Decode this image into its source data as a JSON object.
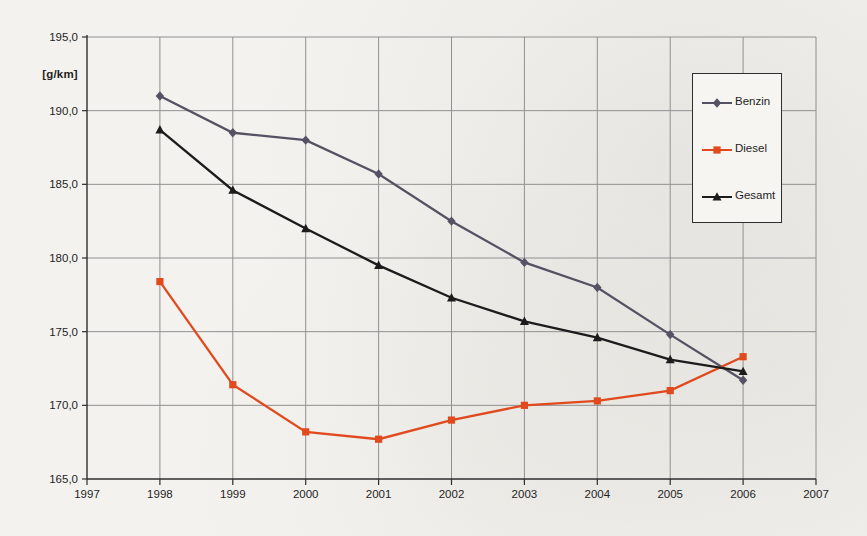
{
  "chart_data": {
    "type": "line",
    "title": "",
    "ylabel": "[g/km]",
    "xlabel": "",
    "xlim": [
      1997,
      2007
    ],
    "ylim": [
      165,
      195
    ],
    "xticks": [
      1997,
      1998,
      1999,
      2000,
      2001,
      2002,
      2003,
      2004,
      2005,
      2006,
      2007
    ],
    "ytick_values": [
      165,
      170,
      175,
      180,
      185,
      190,
      195
    ],
    "ytick_labels": [
      "165,0",
      "170,0",
      "175,0",
      "180,0",
      "185,0",
      "190,0",
      "195,0"
    ],
    "grid": true,
    "legend_position": "inside-top-right",
    "categories": [
      1998,
      1999,
      2000,
      2001,
      2002,
      2003,
      2004,
      2005,
      2006
    ],
    "series": [
      {
        "name": "Benzin",
        "marker": "diamond",
        "color": "#575164",
        "values": [
          191.0,
          188.5,
          188.0,
          185.7,
          182.5,
          179.7,
          178.0,
          174.8,
          171.7
        ]
      },
      {
        "name": "Diesel",
        "marker": "square",
        "color": "#e04a1e",
        "values": [
          178.4,
          171.4,
          168.2,
          167.7,
          169.0,
          170.0,
          170.3,
          171.0,
          173.3
        ]
      },
      {
        "name": "Gesamt",
        "marker": "triangle",
        "color": "#1c1c1c",
        "values": [
          188.7,
          184.6,
          182.0,
          179.5,
          177.3,
          175.7,
          174.6,
          173.1,
          172.3
        ]
      }
    ]
  },
  "colors": {
    "background": "#f3f2ee",
    "gridline": "#909090",
    "axis": "#2e2e2e",
    "tick_text": "#1f1f1f",
    "legend_border": "#2e2e2e",
    "legend_background": "#f6f5f1"
  }
}
